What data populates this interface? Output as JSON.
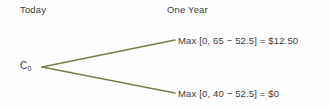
{
  "diagram": {
    "type": "binomial-option-payoff-tree",
    "background_color": "#fefefe",
    "branch_color": "#7a7d4a",
    "text_color": "#3a3a3a",
    "columns": {
      "left_header": "Today",
      "right_header": "One Year"
    },
    "root": {
      "label_base": "C",
      "label_subscript": "0"
    },
    "branches": [
      {
        "position": "up",
        "payoff_text": "Max [0, 65 − 52.5] = $12.50",
        "stock_price": 65,
        "strike_price": 52.5,
        "payoff_value": "$12.50"
      },
      {
        "position": "down",
        "payoff_text": "Max [0, 40 − 52.5] = $0",
        "stock_price": 40,
        "strike_price": 52.5,
        "payoff_value": "$0"
      }
    ]
  }
}
